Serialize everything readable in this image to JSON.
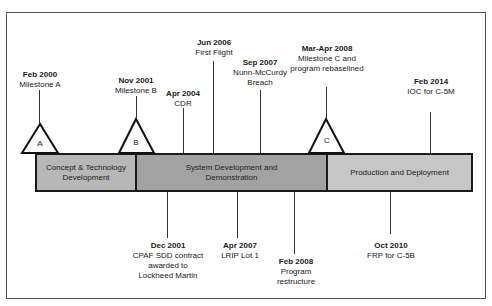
{
  "diagram": {
    "type": "timeline",
    "phases": [
      {
        "label": "Concept & Technology Development",
        "line1": "Concept & Technology",
        "line2": "Development",
        "color": "#b7b7b7"
      },
      {
        "label": "System Development and Demonstration",
        "line1": "System Development and",
        "line2": "Demonstration",
        "color": "#a2a2a2"
      },
      {
        "label": "Production and Deployment",
        "line1": "Production and Deployment",
        "line2": "",
        "color": "#c6c6c6"
      }
    ],
    "milestones": [
      {
        "letter": "A",
        "date": "Feb 2000",
        "desc": [
          "Milestone A"
        ]
      },
      {
        "letter": "B",
        "date": "Nov 2001",
        "desc": [
          "Milestone B"
        ]
      },
      {
        "letter": "C",
        "date": "Mar-Apr 2008",
        "desc": [
          "Milestone C and",
          "program rebaselined"
        ]
      }
    ],
    "events_above": [
      {
        "date": "Apr 2004",
        "desc": [
          "CDR"
        ]
      },
      {
        "date": "Jun 2006",
        "desc": [
          "First Flight"
        ]
      },
      {
        "date": "Sep 2007",
        "desc": [
          "Nunn-McCurdy",
          "Breach"
        ]
      },
      {
        "date": "Feb 2014",
        "desc": [
          "IOC for C-5M"
        ]
      }
    ],
    "events_below": [
      {
        "date": "Dec 2001",
        "desc": [
          "CPAF SDD contract",
          "awarded to",
          "Lockheed Martin"
        ]
      },
      {
        "date": "Apr 2007",
        "desc": [
          "LRIP Lot 1"
        ]
      },
      {
        "date": "Feb 2008",
        "desc": [
          "Program",
          "restructure"
        ]
      },
      {
        "date": "Oct 2010",
        "desc": [
          "FRP for C-5B"
        ]
      }
    ]
  }
}
